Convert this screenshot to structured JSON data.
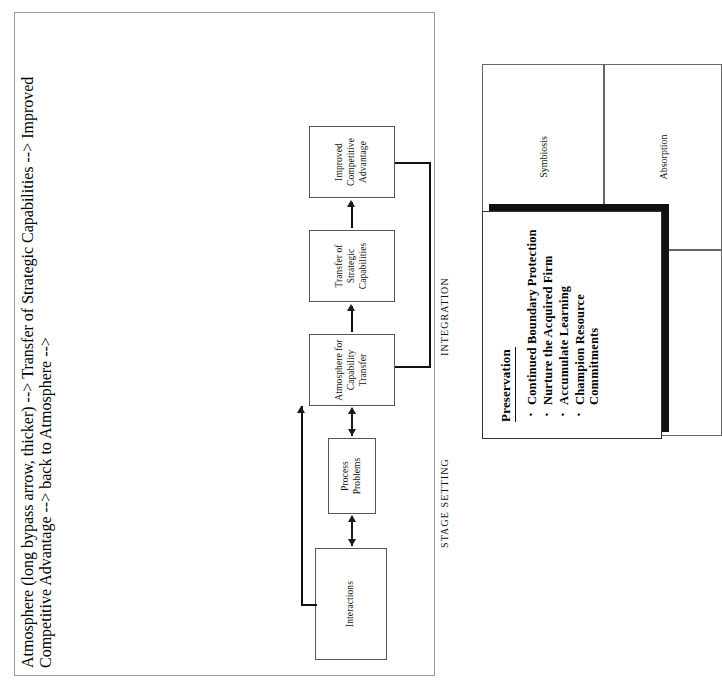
{
  "diagram": {
    "sections": [
      {
        "id": "stage-setting",
        "label": "STAGE SETTING"
      },
      {
        "id": "integration",
        "label": "INTEGRATION"
      }
    ],
    "flow_nodes": [
      {
        "id": "interactions",
        "label": "Interactions"
      },
      {
        "id": "process-problems",
        "line1": "Process",
        "line2": "Problems"
      },
      {
        "id": "atmosphere",
        "line1": "Atmosphere for",
        "line2": "Capability Transfer"
      },
      {
        "id": "transfer",
        "line1": "Transfer of",
        "line2": "Strategic Capabilities"
      },
      {
        "id": "improved",
        "line1": "Improved",
        "line2": "Competitive",
        "line3": "Advantage"
      }
    ],
    "matrix_cells": [
      {
        "id": "top-left",
        "label": ""
      },
      {
        "id": "top-right",
        "label": "Symbiosis"
      },
      {
        "id": "bottom-left",
        "label": ""
      },
      {
        "id": "bottom-right",
        "label": "Absorption"
      }
    ],
    "preservation": {
      "title": "Preservation",
      "bullets": [
        "Continued Boundary Protection",
        "Nurture the Acquired Firm",
        "Accumulate Learning",
        "Champion Resource Commitments"
      ]
    },
    "colors": {
      "frame_border": "#9a9a9a",
      "node_border": "#555555",
      "line": "#1a1a1a",
      "shadow": "#111111",
      "background": "#ffffff"
    }
  }
}
